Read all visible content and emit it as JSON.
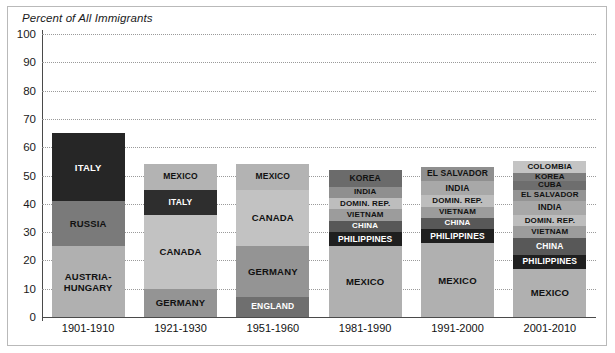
{
  "chart_data": {
    "type": "bar",
    "title": "Percent of All Immigrants",
    "subtype": "stacked-bar",
    "xlabel": "",
    "ylabel": "Percent of All Immigrants",
    "ylim": [
      0,
      100
    ],
    "yticks": [
      0,
      10,
      20,
      30,
      40,
      50,
      60,
      70,
      80,
      90,
      100
    ],
    "ytick_labels": [
      "0",
      "10",
      "20",
      "30",
      "40",
      "50",
      "60",
      "70",
      "80",
      "90",
      "100"
    ],
    "grid": true,
    "legend": "none",
    "categories": [
      "1901-1910",
      "1921-1930",
      "1951-1960",
      "1981-1990",
      "1991-2000",
      "2001-2010"
    ],
    "colors": {
      "very_dark": "#231f20",
      "dark": "#4d4d4d",
      "mid_dark": "#6e6e6e",
      "mid": "#8c8c8c",
      "mid_light": "#a6a6a6",
      "light": "#b3b3b3",
      "lighter": "#bfbfbf",
      "lightest": "#cccccc",
      "axis": "#4a4a4a",
      "grid": "#9a9a9a",
      "frame": "#b9b9b9",
      "text_dark": "#111111",
      "text_light": "#ffffff"
    },
    "bars": [
      {
        "category": "1901-1910",
        "total": 65,
        "segments": [
          {
            "label": "AUSTRIA-\nHUNGARY",
            "value": 25,
            "start": 0,
            "end": 25,
            "color": "#b0b0b0",
            "text_color": "#111111"
          },
          {
            "label": "RUSSIA",
            "value": 16,
            "start": 25,
            "end": 41,
            "color": "#7a7a7a",
            "text_color": "#111111"
          },
          {
            "label": "ITALY",
            "value": 24,
            "start": 41,
            "end": 65,
            "color": "#262626",
            "text_color": "#ffffff"
          }
        ]
      },
      {
        "category": "1921-1930",
        "total": 54,
        "segments": [
          {
            "label": "GERMANY",
            "value": 10,
            "start": 0,
            "end": 10,
            "color": "#949494",
            "text_color": "#111111"
          },
          {
            "label": "CANADA",
            "value": 26,
            "start": 10,
            "end": 36,
            "color": "#c2c2c2",
            "text_color": "#111111"
          },
          {
            "label": "ITALY",
            "value": 9,
            "start": 36,
            "end": 45,
            "color": "#2e2e2e",
            "text_color": "#ffffff"
          },
          {
            "label": "MEXICO",
            "value": 9,
            "start": 45,
            "end": 54,
            "color": "#b3b3b3",
            "text_color": "#111111"
          }
        ]
      },
      {
        "category": "1951-1960",
        "total": 54,
        "segments": [
          {
            "label": "ENGLAND",
            "value": 7,
            "start": 0,
            "end": 7,
            "color": "#6f6f6f",
            "text_color": "#ffffff"
          },
          {
            "label": "GERMANY",
            "value": 18,
            "start": 7,
            "end": 25,
            "color": "#949494",
            "text_color": "#111111"
          },
          {
            "label": "CANADA",
            "value": 20,
            "start": 25,
            "end": 45,
            "color": "#c2c2c2",
            "text_color": "#111111"
          },
          {
            "label": "MEXICO",
            "value": 9,
            "start": 45,
            "end": 54,
            "color": "#b3b3b3",
            "text_color": "#111111"
          }
        ]
      },
      {
        "category": "1981-1990",
        "total": 52,
        "segments": [
          {
            "label": "MEXICO",
            "value": 25,
            "start": 0,
            "end": 25,
            "color": "#b0b0b0",
            "text_color": "#111111"
          },
          {
            "label": "PHILIPPINES",
            "value": 5,
            "start": 25,
            "end": 30,
            "color": "#1f1f1f",
            "text_color": "#ffffff"
          },
          {
            "label": "CHINA",
            "value": 4,
            "start": 30,
            "end": 34,
            "color": "#585858",
            "text_color": "#ffffff"
          },
          {
            "label": "VIETNAM",
            "value": 4,
            "start": 34,
            "end": 38,
            "color": "#9c9c9c",
            "text_color": "#111111"
          },
          {
            "label": "DOMIN. REP.",
            "value": 4,
            "start": 38,
            "end": 42,
            "color": "#bdbdbd",
            "text_color": "#111111"
          },
          {
            "label": "INDIA",
            "value": 4,
            "start": 42,
            "end": 46,
            "color": "#8f8f8f",
            "text_color": "#111111"
          },
          {
            "label": "KOREA",
            "value": 6,
            "start": 46,
            "end": 52,
            "color": "#6b6b6b",
            "text_color": "#111111"
          }
        ]
      },
      {
        "category": "1991-2000",
        "total": 53,
        "segments": [
          {
            "label": "MEXICO",
            "value": 26,
            "start": 0,
            "end": 26,
            "color": "#b0b0b0",
            "text_color": "#111111"
          },
          {
            "label": "PHILIPPINES",
            "value": 5,
            "start": 26,
            "end": 31,
            "color": "#1f1f1f",
            "text_color": "#ffffff"
          },
          {
            "label": "CHINA",
            "value": 4,
            "start": 31,
            "end": 35,
            "color": "#585858",
            "text_color": "#ffffff"
          },
          {
            "label": "VIETNAM",
            "value": 4,
            "start": 35,
            "end": 39,
            "color": "#9c9c9c",
            "text_color": "#111111"
          },
          {
            "label": "DOMIN. REP.",
            "value": 4,
            "start": 39,
            "end": 43,
            "color": "#bdbdbd",
            "text_color": "#111111"
          },
          {
            "label": "INDIA",
            "value": 5,
            "start": 43,
            "end": 48,
            "color": "#a8a8a8",
            "text_color": "#111111"
          },
          {
            "label": "EL SALVADOR",
            "value": 5,
            "start": 48,
            "end": 53,
            "color": "#8f8f8f",
            "text_color": "#111111"
          }
        ]
      },
      {
        "category": "2001-2010",
        "total": 55,
        "segments": [
          {
            "label": "MEXICO",
            "value": 17,
            "start": 0,
            "end": 17,
            "color": "#b0b0b0",
            "text_color": "#111111"
          },
          {
            "label": "PHILIPPINES",
            "value": 5,
            "start": 17,
            "end": 22,
            "color": "#1f1f1f",
            "text_color": "#ffffff"
          },
          {
            "label": "CHINA",
            "value": 6,
            "start": 22,
            "end": 28,
            "color": "#585858",
            "text_color": "#ffffff"
          },
          {
            "label": "VIETNAM",
            "value": 4,
            "start": 28,
            "end": 32,
            "color": "#9c9c9c",
            "text_color": "#111111"
          },
          {
            "label": "DOMIN. REP.",
            "value": 4,
            "start": 32,
            "end": 36,
            "color": "#bdbdbd",
            "text_color": "#111111"
          },
          {
            "label": "INDIA",
            "value": 5,
            "start": 36,
            "end": 41,
            "color": "#a8a8a8",
            "text_color": "#111111"
          },
          {
            "label": "EL SALVADOR",
            "value": 4,
            "start": 41,
            "end": 45,
            "color": "#949494",
            "text_color": "#111111"
          },
          {
            "label": "CUBA",
            "value": 3,
            "start": 45,
            "end": 48,
            "color": "#6e6e6e",
            "text_color": "#111111"
          },
          {
            "label": "KOREA",
            "value": 3,
            "start": 48,
            "end": 51,
            "color": "#7d7d7d",
            "text_color": "#111111"
          },
          {
            "label": "COLOMBIA",
            "value": 4,
            "start": 51,
            "end": 55,
            "color": "#c4c4c4",
            "text_color": "#111111"
          }
        ]
      }
    ]
  }
}
